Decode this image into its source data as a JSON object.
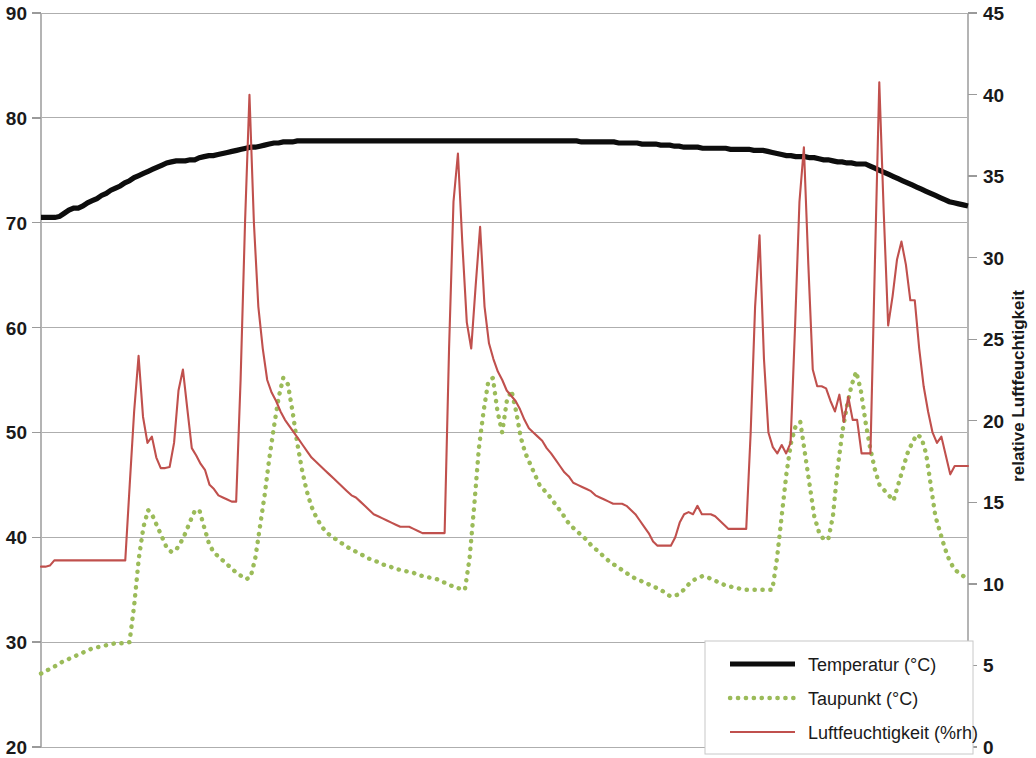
{
  "chart_data": {
    "type": "line",
    "title": "",
    "xlabel": "",
    "ylabel": "",
    "y2label": "relative Luftfeuchtigkeit",
    "grid": true,
    "legend_position": "bottom-right",
    "ylim": [
      20,
      90
    ],
    "y2lim": [
      0,
      45
    ],
    "xlim": [
      0,
      200
    ],
    "yticks": [
      20,
      30,
      40,
      50,
      60,
      70,
      80,
      90
    ],
    "ytick_labels": [
      "20",
      "30",
      "40",
      "50",
      "60",
      "70",
      "80",
      "90"
    ],
    "y2ticks": [
      0,
      5,
      10,
      15,
      20,
      25,
      30,
      35,
      40,
      45
    ],
    "y2tick_labels": [
      "0",
      "5",
      "10",
      "15",
      "20",
      "25",
      "30",
      "35",
      "40",
      "45"
    ],
    "xticks": [],
    "xtick_labels": [],
    "series": [
      {
        "name": "Temperatur (°C)",
        "axis": "left",
        "color": "#0d0d0d",
        "style": "solid",
        "width": 5.2,
        "values": [
          70.5,
          70.5,
          70.5,
          70.5,
          70.6,
          70.9,
          71.2,
          71.4,
          71.4,
          71.6,
          71.9,
          72.1,
          72.3,
          72.6,
          72.8,
          73.1,
          73.3,
          73.5,
          73.8,
          74.0,
          74.3,
          74.5,
          74.7,
          74.9,
          75.1,
          75.3,
          75.5,
          75.7,
          75.8,
          75.9,
          75.9,
          75.9,
          76.0,
          76.0,
          76.2,
          76.3,
          76.4,
          76.4,
          76.5,
          76.6,
          76.7,
          76.8,
          76.9,
          77.0,
          77.1,
          77.2,
          77.2,
          77.3,
          77.4,
          77.5,
          77.6,
          77.6,
          77.7,
          77.7,
          77.7,
          77.8,
          77.8,
          77.8,
          77.8,
          77.8,
          77.8,
          77.8,
          77.8,
          77.8,
          77.8,
          77.8,
          77.8,
          77.8,
          77.8,
          77.8,
          77.8,
          77.8,
          77.8,
          77.8,
          77.8,
          77.8,
          77.8,
          77.8,
          77.8,
          77.8,
          77.8,
          77.8,
          77.8,
          77.8,
          77.8,
          77.8,
          77.8,
          77.8,
          77.8,
          77.8,
          77.8,
          77.8,
          77.8,
          77.8,
          77.8,
          77.8,
          77.8,
          77.8,
          77.8,
          77.8,
          77.8,
          77.8,
          77.8,
          77.8,
          77.8,
          77.8,
          77.8,
          77.8,
          77.8,
          77.8,
          77.8,
          77.8,
          77.8,
          77.8,
          77.8,
          77.8,
          77.7,
          77.7,
          77.7,
          77.7,
          77.7,
          77.7,
          77.7,
          77.7,
          77.6,
          77.6,
          77.6,
          77.6,
          77.6,
          77.5,
          77.5,
          77.5,
          77.5,
          77.4,
          77.4,
          77.4,
          77.3,
          77.3,
          77.2,
          77.2,
          77.2,
          77.2,
          77.1,
          77.1,
          77.1,
          77.1,
          77.1,
          77.1,
          77.0,
          77.0,
          77.0,
          77.0,
          77.0,
          76.9,
          76.9,
          76.9,
          76.8,
          76.7,
          76.6,
          76.5,
          76.4,
          76.4,
          76.3,
          76.3,
          76.3,
          76.2,
          76.2,
          76.1,
          76.0,
          76.0,
          75.9,
          75.8,
          75.8,
          75.7,
          75.7,
          75.6,
          75.6,
          75.6,
          75.4,
          75.2,
          75.0,
          74.8,
          74.6,
          74.4,
          74.2,
          74.0,
          73.8,
          73.6,
          73.4,
          73.2,
          73.0,
          72.8,
          72.6,
          72.4,
          72.2,
          72.0,
          71.9,
          71.8,
          71.7,
          71.6
        ]
      },
      {
        "name": "Taupunkt (°C)",
        "axis": "left",
        "color": "#9bbb59",
        "style": "dotted",
        "width": 4.4,
        "values": [
          27.0,
          27.2,
          27.5,
          27.7,
          28.0,
          28.2,
          28.4,
          28.6,
          28.8,
          29.0,
          29.2,
          29.4,
          29.5,
          29.6,
          29.7,
          29.8,
          29.9,
          29.9,
          29.9,
          30.0,
          33.5,
          38.0,
          41.0,
          42.6,
          42.0,
          41.0,
          40.0,
          39.0,
          38.6,
          38.8,
          39.5,
          40.4,
          41.5,
          42.5,
          42.6,
          41.0,
          39.5,
          38.6,
          38.2,
          37.8,
          37.4,
          37.0,
          36.6,
          36.3,
          36.0,
          36.2,
          38.0,
          41.0,
          44.0,
          47.5,
          50.5,
          53.3,
          55.2,
          54.6,
          52.0,
          49.0,
          46.5,
          44.5,
          43.0,
          42.0,
          41.2,
          40.6,
          40.2,
          39.9,
          39.6,
          39.3,
          39.0,
          38.8,
          38.5,
          38.3,
          38.0,
          37.9,
          37.7,
          37.5,
          37.3,
          37.2,
          37.0,
          36.9,
          36.8,
          36.7,
          36.6,
          36.4,
          36.3,
          36.2,
          36.1,
          36.0,
          35.8,
          35.6,
          35.4,
          35.2,
          35.1,
          35.0,
          38.0,
          43.0,
          48.5,
          52.0,
          54.8,
          55.2,
          52.0,
          50.0,
          53.0,
          54.0,
          52.0,
          49.5,
          48.0,
          47.0,
          46.0,
          45.0,
          44.5,
          44.0,
          43.4,
          42.8,
          42.2,
          41.5,
          41.0,
          40.6,
          40.2,
          39.8,
          39.3,
          38.9,
          38.5,
          38.1,
          37.7,
          37.4,
          37.1,
          36.8,
          36.5,
          36.2,
          36.0,
          35.8,
          35.6,
          35.4,
          35.2,
          35.0,
          34.7,
          34.4,
          34.4,
          34.6,
          35.0,
          35.5,
          35.9,
          36.1,
          36.3,
          36.2,
          36.0,
          35.8,
          35.6,
          35.4,
          35.3,
          35.2,
          35.1,
          35.0,
          35.0,
          35.0,
          35.0,
          35.0,
          35.0,
          35.0,
          38.0,
          42.0,
          46.0,
          49.0,
          50.6,
          51.0,
          48.0,
          45.0,
          42.0,
          40.5,
          39.8,
          39.8,
          42.0,
          46.5,
          50.0,
          52.5,
          54.5,
          55.8,
          54.0,
          51.0,
          48.5,
          46.5,
          45.0,
          44.5,
          44.0,
          43.5,
          45.0,
          46.5,
          48.0,
          49.0,
          49.8,
          49.5,
          48.0,
          45.0,
          42.0,
          40.5,
          39.0,
          37.8,
          37.0,
          36.6,
          36.3,
          36.0
        ]
      },
      {
        "name": "Luftfeuchtigkeit (%rh)",
        "axis": "right",
        "color": "#c0504d",
        "style": "solid",
        "width": 2.1,
        "values_left_scale": [
          37.2,
          37.2,
          37.3,
          37.8,
          37.8,
          37.8,
          37.8,
          37.8,
          37.8,
          37.8,
          37.8,
          37.8,
          37.8,
          37.8,
          37.8,
          37.8,
          37.8,
          37.8,
          37.8,
          37.8,
          45.0,
          52.0,
          57.3,
          51.5,
          49.0,
          49.6,
          47.6,
          46.6,
          46.6,
          46.7,
          49.0,
          54.0,
          56.0,
          52.2,
          48.5,
          47.8,
          47.0,
          46.4,
          45.0,
          44.6,
          44.0,
          43.8,
          43.6,
          43.4,
          43.4,
          55.0,
          70.0,
          82.2,
          70.0,
          62.0,
          58.0,
          55.0,
          53.8,
          53.0,
          52.0,
          51.2,
          50.6,
          50.0,
          49.4,
          48.8,
          48.2,
          47.6,
          47.2,
          46.8,
          46.4,
          46.0,
          45.6,
          45.2,
          44.8,
          44.4,
          44.0,
          43.8,
          43.4,
          43.0,
          42.6,
          42.2,
          42.0,
          41.8,
          41.6,
          41.4,
          41.2,
          41.0,
          41.0,
          41.0,
          40.8,
          40.6,
          40.4,
          40.4,
          40.4,
          40.4,
          40.4,
          40.4,
          58.0,
          72.0,
          76.6,
          68.0,
          60.5,
          58.0,
          64.0,
          69.6,
          62.0,
          58.5,
          57.0,
          55.8,
          55.0,
          54.0,
          53.5,
          53.0,
          52.2,
          51.2,
          50.4,
          50.0,
          49.6,
          49.2,
          48.5,
          48.0,
          47.4,
          46.8,
          46.2,
          45.8,
          45.2,
          45.0,
          44.8,
          44.6,
          44.4,
          44.0,
          43.8,
          43.6,
          43.4,
          43.2,
          43.2,
          43.2,
          43.0,
          42.6,
          42.2,
          41.6,
          41.0,
          40.4,
          39.6,
          39.2,
          39.2,
          39.2,
          39.2,
          40.0,
          41.4,
          42.2,
          42.4,
          42.2,
          43.0,
          42.2,
          42.2,
          42.2,
          42.0,
          41.6,
          41.2,
          40.8,
          40.8,
          40.8,
          40.8,
          40.8,
          50.0,
          62.0,
          68.8,
          57.0,
          50.0,
          48.6,
          48.0,
          48.8,
          48.0,
          49.0,
          60.0,
          72.0,
          77.2,
          66.0,
          56.0,
          54.4,
          54.4,
          54.2,
          53.0,
          52.0,
          53.6,
          51.0,
          53.4,
          51.2,
          51.2,
          48.0,
          48.0,
          48.0,
          66.0,
          83.4,
          71.0,
          60.2,
          63.0,
          66.5,
          68.2,
          66.0,
          62.6,
          62.6,
          58.0,
          54.4,
          52.0,
          50.0,
          49.0,
          49.6,
          47.8,
          46.0,
          46.8,
          46.8,
          46.8,
          46.8
        ]
      }
    ]
  },
  "axes": {
    "left": {
      "name": "left-value-axis",
      "labels": [
        "90",
        "80",
        "70",
        "60",
        "50",
        "40",
        "30",
        "20"
      ]
    },
    "right": {
      "name": "right-value-axis",
      "title": "relative Luftfeuchtigkeit",
      "labels": [
        "45",
        "40",
        "35",
        "30",
        "25",
        "20",
        "15",
        "10",
        "5",
        "0"
      ]
    }
  },
  "legend": {
    "items": [
      {
        "label": "Temperatur (°C)",
        "color": "#0d0d0d",
        "style": "solid"
      },
      {
        "label": "Taupunkt (°C)",
        "color": "#9bbb59",
        "style": "dotted"
      },
      {
        "label": "Luftfeuchtigkeit (%rh)",
        "color": "#c0504d",
        "style": "solid"
      }
    ]
  }
}
